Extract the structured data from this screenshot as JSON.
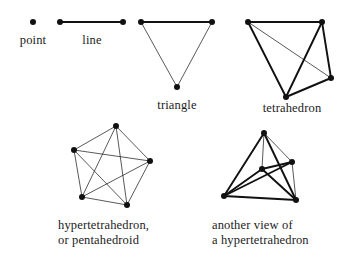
{
  "figure": {
    "background_color": "#ffffff",
    "ink_color": "#111111",
    "thick_stroke": 1.9,
    "thin_stroke": 0.7,
    "vertex_radius": 3.0,
    "canvas": {
      "width": 353,
      "height": 264
    }
  },
  "captions": [
    {
      "id": "point",
      "lines": [
        "point"
      ],
      "x": 33,
      "y": 33,
      "align": "center"
    },
    {
      "id": "line",
      "lines": [
        "line"
      ],
      "x": 92,
      "y": 33,
      "align": "center"
    },
    {
      "id": "triangle",
      "lines": [
        "triangle"
      ],
      "x": 177,
      "y": 98,
      "align": "center"
    },
    {
      "id": "tetrahedron",
      "lines": [
        "tetrahedron"
      ],
      "x": 292,
      "y": 101,
      "align": "center"
    },
    {
      "id": "pentahedroid",
      "lines": [
        "hypertetrahedron,",
        "or pentahedroid"
      ],
      "x": 58,
      "y": 218,
      "align": "left"
    },
    {
      "id": "another-view",
      "lines": [
        "another view of",
        "a hypertetrahedron"
      ],
      "x": 212,
      "y": 218,
      "align": "left"
    }
  ],
  "figures": [
    {
      "id": "point",
      "name": "point",
      "vertices": [
        {
          "x": 33,
          "y": 22
        }
      ],
      "edges": []
    },
    {
      "id": "line",
      "name": "line",
      "vertices": [
        {
          "x": 60,
          "y": 22
        },
        {
          "x": 123,
          "y": 22
        }
      ],
      "edges": [
        {
          "a": 0,
          "b": 1,
          "weight": "thick"
        }
      ]
    },
    {
      "id": "triangle",
      "name": "triangle",
      "vertices": [
        {
          "x": 141,
          "y": 22
        },
        {
          "x": 212,
          "y": 22
        },
        {
          "x": 177,
          "y": 87
        }
      ],
      "edges": [
        {
          "a": 0,
          "b": 1,
          "weight": "thick"
        },
        {
          "a": 1,
          "b": 2,
          "weight": "thin"
        },
        {
          "a": 2,
          "b": 0,
          "weight": "thin"
        }
      ]
    },
    {
      "id": "tetrahedron",
      "name": "tetrahedron",
      "vertices": [
        {
          "x": 248,
          "y": 22
        },
        {
          "x": 322,
          "y": 22
        },
        {
          "x": 331,
          "y": 78
        },
        {
          "x": 286,
          "y": 97
        }
      ],
      "edges": [
        {
          "a": 0,
          "b": 1,
          "weight": "thick"
        },
        {
          "a": 0,
          "b": 2,
          "weight": "thin"
        },
        {
          "a": 0,
          "b": 3,
          "weight": "thick"
        },
        {
          "a": 1,
          "b": 2,
          "weight": "thick"
        },
        {
          "a": 1,
          "b": 3,
          "weight": "thick"
        },
        {
          "a": 2,
          "b": 3,
          "weight": "thick"
        }
      ]
    },
    {
      "id": "pentahedroid",
      "name": "hypertetrahedron, or pentahedroid",
      "vertices": [
        {
          "x": 116,
          "y": 126
        },
        {
          "x": 74,
          "y": 150
        },
        {
          "x": 150,
          "y": 161
        },
        {
          "x": 82,
          "y": 197
        },
        {
          "x": 127,
          "y": 205
        }
      ],
      "edges": [
        {
          "a": 0,
          "b": 1,
          "weight": "thin"
        },
        {
          "a": 0,
          "b": 2,
          "weight": "thin"
        },
        {
          "a": 0,
          "b": 3,
          "weight": "thin"
        },
        {
          "a": 0,
          "b": 4,
          "weight": "thin"
        },
        {
          "a": 1,
          "b": 2,
          "weight": "thin"
        },
        {
          "a": 1,
          "b": 3,
          "weight": "thin"
        },
        {
          "a": 1,
          "b": 4,
          "weight": "thin"
        },
        {
          "a": 2,
          "b": 3,
          "weight": "thin"
        },
        {
          "a": 2,
          "b": 4,
          "weight": "thin"
        },
        {
          "a": 3,
          "b": 4,
          "weight": "thin"
        }
      ]
    },
    {
      "id": "another-view",
      "name": "another view of a hypertetrahedron",
      "vertices": [
        {
          "x": 264,
          "y": 133
        },
        {
          "x": 292,
          "y": 162
        },
        {
          "x": 262,
          "y": 169
        },
        {
          "x": 224,
          "y": 196
        },
        {
          "x": 296,
          "y": 200
        }
      ],
      "edges": [
        {
          "a": 0,
          "b": 1,
          "weight": "thin"
        },
        {
          "a": 0,
          "b": 2,
          "weight": "thin"
        },
        {
          "a": 0,
          "b": 3,
          "weight": "thick"
        },
        {
          "a": 0,
          "b": 4,
          "weight": "thick"
        },
        {
          "a": 1,
          "b": 2,
          "weight": "thick"
        },
        {
          "a": 1,
          "b": 3,
          "weight": "thick"
        },
        {
          "a": 1,
          "b": 4,
          "weight": "thin"
        },
        {
          "a": 2,
          "b": 3,
          "weight": "thick"
        },
        {
          "a": 2,
          "b": 4,
          "weight": "thick"
        },
        {
          "a": 3,
          "b": 4,
          "weight": "thick"
        }
      ]
    }
  ]
}
